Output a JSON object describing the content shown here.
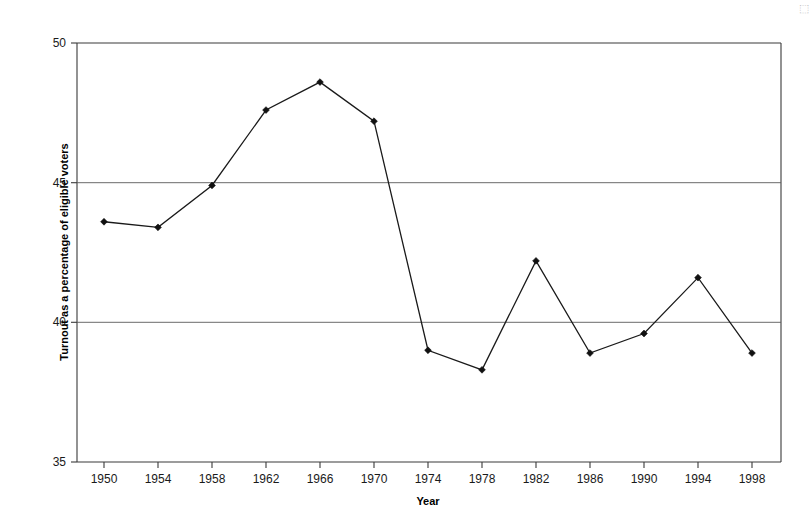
{
  "page": {
    "background_color": "#ffffff",
    "corner_mark": "⬚"
  },
  "chart_data": {
    "type": "line",
    "title": "",
    "subtitle": "",
    "xlabel": "Year",
    "ylabel": "Turnout as a percentage of eligible voters",
    "categories": [
      1950,
      1954,
      1958,
      1962,
      1966,
      1970,
      1974,
      1978,
      1982,
      1986,
      1990,
      1994,
      1998
    ],
    "x_tick_labels": [
      "1950",
      "1954",
      "1958",
      "1962",
      "1966",
      "1970",
      "1974",
      "1978",
      "1982",
      "1986",
      "1990",
      "1994",
      "1998"
    ],
    "values": [
      43.6,
      43.4,
      44.9,
      47.6,
      48.6,
      47.2,
      39.0,
      38.3,
      42.2,
      38.9,
      39.6,
      41.6,
      38.9
    ],
    "y_tick_labels": [
      "50",
      "45",
      "40",
      "35"
    ],
    "y_ticks": [
      50,
      45,
      40,
      35
    ],
    "ylim": [
      35,
      50
    ],
    "xlim": [
      1948,
      2000
    ],
    "grid": "horizontal-only",
    "gridline_values": [
      45,
      40
    ],
    "legend": "none",
    "legend_position": "none",
    "series": [
      {
        "name": "Turnout",
        "marker": "diamond",
        "line_color": "#1a1a1a",
        "marker_color": "#111111",
        "values": [
          43.6,
          43.4,
          44.9,
          47.6,
          48.6,
          47.2,
          39.0,
          38.3,
          42.2,
          38.9,
          39.6,
          41.6,
          38.9
        ]
      }
    ],
    "annotations": []
  },
  "colors": {
    "axis": "#3a3a3a",
    "grid": "#5a5a5a",
    "line": "#1a1a1a",
    "text": "#1a1a1a"
  }
}
